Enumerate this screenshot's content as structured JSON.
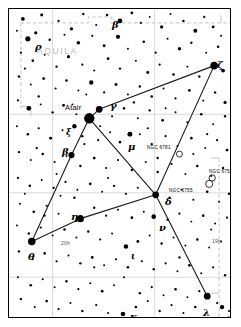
{
  "figure": {
    "kind": "star-chart",
    "constellation_label": "AQUILA",
    "width": 241,
    "height": 327,
    "background": "#ffffff",
    "frame_color": "#000000",
    "grid_color": "#c8c8c8",
    "boundary_color": "#bdbdbd",
    "line_color": "#1a1a1a",
    "star_color": "#000000"
  },
  "labels": {
    "constellation": "AQUILA",
    "proper_star": "Atair",
    "hour_left": "20h",
    "hour_right": "19h",
    "flamsteed_12": "12"
  },
  "greek_labels": [
    {
      "id": "beta-top",
      "text": "β",
      "x": 103,
      "y": 11,
      "size": "lg"
    },
    {
      "id": "rho",
      "text": "ρ",
      "x": 26,
      "y": 33,
      "size": "lg"
    },
    {
      "id": "zeta",
      "text": "ζ",
      "x": 208,
      "y": 51,
      "size": "lg"
    },
    {
      "id": "gamma",
      "text": "γ",
      "x": 101,
      "y": 92,
      "size": "lg"
    },
    {
      "id": "xi",
      "text": "ξ",
      "x": 57,
      "y": 119,
      "size": "sm"
    },
    {
      "id": "beta-aql",
      "text": "β",
      "x": 53,
      "y": 138,
      "size": "lg"
    },
    {
      "id": "mu",
      "text": "μ",
      "x": 119,
      "y": 133,
      "size": "lg"
    },
    {
      "id": "delta",
      "text": "δ",
      "x": 156,
      "y": 188,
      "size": "lg"
    },
    {
      "id": "eta",
      "text": "η",
      "x": 62,
      "y": 203,
      "size": "lg"
    },
    {
      "id": "nu",
      "text": "ν",
      "x": 150,
      "y": 214,
      "size": "lg"
    },
    {
      "id": "theta",
      "text": "θ",
      "x": 19,
      "y": 243,
      "size": "lg"
    },
    {
      "id": "iota",
      "text": "ι",
      "x": 122,
      "y": 243,
      "size": "sm"
    },
    {
      "id": "lambda",
      "text": "λ",
      "x": 194,
      "y": 299,
      "size": "lg"
    },
    {
      "id": "kappa",
      "text": "κ",
      "x": 121,
      "y": 303,
      "size": "lg"
    }
  ],
  "deepsky": [
    {
      "id": "ngc-6781",
      "label": "NGC 6781",
      "label_x": 138,
      "label_y": 137,
      "x": 172,
      "y": 146,
      "r": 3.0,
      "type": "planetary-nebula"
    },
    {
      "id": "ngc-6756",
      "label": "NGC 6756",
      "label_x": 200,
      "label_y": 161,
      "x": 205,
      "y": 170,
      "r": 3.2,
      "type": "open-cluster"
    },
    {
      "id": "ngc-6755",
      "label": "NGC 6755",
      "label_x": 160,
      "label_y": 180,
      "x": 202,
      "y": 176,
      "r": 3.6,
      "type": "open-cluster"
    }
  ],
  "hour_marks": [
    {
      "text": "20h",
      "x": 52,
      "y": 232
    },
    {
      "text": "19h",
      "x": 203,
      "y": 230
    }
  ],
  "flamsteed": [
    {
      "text": "12",
      "x": 218,
      "y": 307
    }
  ],
  "chart_data": {
    "type": "scatter",
    "xlabel": "Right ascension",
    "ylabel": "Declination",
    "grid": true,
    "legend": "none",
    "xlim": [
      0,
      223
    ],
    "ylim": [
      0,
      310
    ],
    "grid_lines": {
      "vertical_x": [
        44,
        147
      ],
      "horizontal_y": [
        106,
        185,
        270
      ],
      "note": "light grey coordinate graticule inside frame"
    },
    "constellation_lines": [
      {
        "from": "zeta",
        "to": "gamma",
        "x1": 207,
        "y1": 57,
        "x2": 91,
        "y2": 101
      },
      {
        "from": "gamma",
        "to": "altair",
        "x1": 91,
        "y1": 101,
        "x2": 81,
        "y2": 110
      },
      {
        "from": "altair",
        "to": "beta",
        "x1": 81,
        "y1": 110,
        "x2": 63,
        "y2": 147
      },
      {
        "from": "beta",
        "to": "theta",
        "x1": 63,
        "y1": 147,
        "x2": 23,
        "y2": 234
      },
      {
        "from": "theta",
        "to": "eta",
        "x1": 23,
        "y1": 234,
        "x2": 72,
        "y2": 211
      },
      {
        "from": "eta",
        "to": "delta",
        "x1": 72,
        "y1": 211,
        "x2": 148,
        "y2": 187
      },
      {
        "from": "delta",
        "to": "altair",
        "x1": 148,
        "y1": 187,
        "x2": 81,
        "y2": 110
      },
      {
        "from": "zeta",
        "to": "delta",
        "x1": 207,
        "y1": 57,
        "x2": 148,
        "y2": 187
      },
      {
        "from": "delta",
        "to": "lambda",
        "x1": 148,
        "y1": 187,
        "x2": 200,
        "y2": 289
      }
    ],
    "named_stars": [
      {
        "name": "Atair",
        "bayer": "alpha",
        "x": 81,
        "y": 110,
        "mag_r": 5.2
      },
      {
        "name": "Gamma",
        "bayer": "gamma",
        "x": 91,
        "y": 101,
        "mag_r": 3.4
      },
      {
        "name": "Beta",
        "bayer": "beta",
        "x": 63,
        "y": 147,
        "mag_r": 3.1
      },
      {
        "name": "Zeta",
        "bayer": "zeta",
        "x": 207,
        "y": 57,
        "mag_r": 3.8
      },
      {
        "name": "Delta",
        "bayer": "delta",
        "x": 148,
        "y": 187,
        "mag_r": 3.4
      },
      {
        "name": "Eta",
        "bayer": "eta",
        "x": 72,
        "y": 211,
        "mag_r": 3.6
      },
      {
        "name": "Theta",
        "bayer": "theta",
        "x": 23,
        "y": 234,
        "mag_r": 3.8
      },
      {
        "name": "Lambda",
        "bayer": "lambda",
        "x": 200,
        "y": 289,
        "mag_r": 3.4
      },
      {
        "name": "Nu",
        "bayer": "nu",
        "x": 146,
        "y": 209,
        "mag_r": 2.3
      },
      {
        "name": "Mu",
        "bayer": "mu",
        "x": 122,
        "y": 126,
        "mag_r": 2.5
      },
      {
        "name": "Xi",
        "bayer": "xi",
        "x": 66,
        "y": 118,
        "mag_r": 2.2
      },
      {
        "name": "Kappa",
        "bayer": "kappa",
        "x": 115,
        "y": 307,
        "mag_r": 2.3
      },
      {
        "name": "Iota",
        "bayer": "iota",
        "x": 118,
        "y": 239,
        "mag_r": 2.3
      },
      {
        "name": "Rho",
        "bayer": "rho",
        "x": 19,
        "y": 30,
        "mag_r": 2.6
      },
      {
        "name": "Beta-top",
        "bayer": "beta",
        "x": 112,
        "y": 12,
        "mag_r": 2.4
      },
      {
        "name": "12",
        "bayer": "12",
        "x": 215,
        "y": 300,
        "mag_r": 2.2
      }
    ],
    "field_stars": [
      [
        14,
        10,
        1.9
      ],
      [
        33,
        6,
        1.5
      ],
      [
        50,
        12,
        1.1
      ],
      [
        63,
        20,
        1.7
      ],
      [
        75,
        5,
        1.2
      ],
      [
        88,
        16,
        1.0
      ],
      [
        99,
        6,
        1.3
      ],
      [
        124,
        4,
        1.4
      ],
      [
        133,
        14,
        1.1
      ],
      [
        142,
        8,
        0.9
      ],
      [
        154,
        18,
        1.6
      ],
      [
        163,
        5,
        1.0
      ],
      [
        176,
        12,
        1.2
      ],
      [
        188,
        22,
        2.0
      ],
      [
        197,
        8,
        1.1
      ],
      [
        206,
        18,
        1.4
      ],
      [
        214,
        27,
        1.0
      ],
      [
        8,
        22,
        1.0
      ],
      [
        27,
        24,
        1.6
      ],
      [
        41,
        31,
        1.2
      ],
      [
        56,
        26,
        1.0
      ],
      [
        70,
        34,
        1.8
      ],
      [
        84,
        27,
        1.1
      ],
      [
        96,
        37,
        1.5
      ],
      [
        110,
        28,
        2.1
      ],
      [
        120,
        40,
        1.0
      ],
      [
        136,
        33,
        1.3
      ],
      [
        148,
        44,
        1.1
      ],
      [
        160,
        30,
        1.0
      ],
      [
        172,
        40,
        1.7
      ],
      [
        184,
        34,
        1.2
      ],
      [
        199,
        44,
        1.0
      ],
      [
        211,
        38,
        1.3
      ],
      [
        12,
        44,
        1.1
      ],
      [
        24,
        52,
        1.3
      ],
      [
        36,
        46,
        1.0
      ],
      [
        48,
        58,
        1.2
      ],
      [
        60,
        48,
        1.6
      ],
      [
        74,
        56,
        1.1
      ],
      [
        86,
        62,
        1.0
      ],
      [
        100,
        50,
        1.4
      ],
      [
        112,
        60,
        1.2
      ],
      [
        128,
        52,
        1.0
      ],
      [
        140,
        64,
        1.5
      ],
      [
        152,
        56,
        1.1
      ],
      [
        166,
        66,
        1.3
      ],
      [
        180,
        58,
        1.0
      ],
      [
        192,
        68,
        1.2
      ],
      [
        216,
        62,
        1.9
      ],
      [
        10,
        68,
        1.2
      ],
      [
        22,
        76,
        1.0
      ],
      [
        35,
        70,
        1.4
      ],
      [
        47,
        80,
        1.1
      ],
      [
        58,
        72,
        1.3
      ],
      [
        70,
        82,
        1.0
      ],
      [
        83,
        74,
        2.2
      ],
      [
        96,
        84,
        1.1
      ],
      [
        108,
        76,
        1.5
      ],
      [
        120,
        86,
        1.0
      ],
      [
        132,
        78,
        1.2
      ],
      [
        144,
        88,
        1.3
      ],
      [
        156,
        80,
        1.0
      ],
      [
        168,
        90,
        1.1
      ],
      [
        182,
        82,
        1.4
      ],
      [
        196,
        92,
        1.0
      ],
      [
        208,
        84,
        1.2
      ],
      [
        218,
        94,
        1.6
      ],
      [
        9,
        92,
        1.1
      ],
      [
        20,
        100,
        2.4
      ],
      [
        32,
        96,
        1.0
      ],
      [
        44,
        104,
        1.2
      ],
      [
        55,
        97,
        1.5
      ],
      [
        68,
        106,
        1.0
      ],
      [
        104,
        108,
        1.1
      ],
      [
        116,
        100,
        1.3
      ],
      [
        130,
        110,
        1.0
      ],
      [
        142,
        102,
        1.2
      ],
      [
        155,
        112,
        1.4
      ],
      [
        168,
        104,
        1.0
      ],
      [
        180,
        114,
        1.1
      ],
      [
        194,
        106,
        1.3
      ],
      [
        206,
        116,
        1.0
      ],
      [
        218,
        108,
        1.2
      ],
      [
        8,
        118,
        1.0
      ],
      [
        19,
        126,
        1.3
      ],
      [
        30,
        120,
        1.1
      ],
      [
        42,
        130,
        1.5
      ],
      [
        54,
        122,
        1.0
      ],
      [
        74,
        128,
        1.2
      ],
      [
        90,
        132,
        1.1
      ],
      [
        102,
        124,
        1.0
      ],
      [
        112,
        134,
        1.3
      ],
      [
        132,
        126,
        1.0
      ],
      [
        144,
        136,
        1.2
      ],
      [
        158,
        128,
        1.1
      ],
      [
        170,
        138,
        1.0
      ],
      [
        184,
        130,
        1.3
      ],
      [
        198,
        140,
        1.0
      ],
      [
        210,
        132,
        1.1
      ],
      [
        220,
        142,
        1.4
      ],
      [
        10,
        144,
        1.2
      ],
      [
        22,
        152,
        1.0
      ],
      [
        34,
        146,
        1.3
      ],
      [
        46,
        154,
        1.1
      ],
      [
        58,
        148,
        1.0
      ],
      [
        72,
        158,
        1.2
      ],
      [
        86,
        150,
        1.4
      ],
      [
        98,
        160,
        1.0
      ],
      [
        110,
        152,
        1.1
      ],
      [
        124,
        162,
        1.3
      ],
      [
        138,
        154,
        1.0
      ],
      [
        150,
        164,
        1.2
      ],
      [
        164,
        156,
        1.1
      ],
      [
        178,
        166,
        1.0
      ],
      [
        190,
        158,
        1.3
      ],
      [
        204,
        168,
        1.0
      ],
      [
        216,
        160,
        1.2
      ],
      [
        9,
        170,
        1.1
      ],
      [
        21,
        178,
        1.3
      ],
      [
        33,
        172,
        1.0
      ],
      [
        45,
        180,
        1.2
      ],
      [
        57,
        174,
        1.1
      ],
      [
        69,
        182,
        1.0
      ],
      [
        82,
        176,
        1.4
      ],
      [
        94,
        184,
        1.0
      ],
      [
        106,
        178,
        1.2
      ],
      [
        118,
        186,
        1.1
      ],
      [
        130,
        180,
        1.0
      ],
      [
        162,
        190,
        1.2
      ],
      [
        174,
        182,
        1.0
      ],
      [
        186,
        192,
        1.1
      ],
      [
        200,
        184,
        1.3
      ],
      [
        212,
        194,
        1.0
      ],
      [
        222,
        186,
        1.2
      ],
      [
        11,
        196,
        1.0
      ],
      [
        25,
        204,
        1.3
      ],
      [
        38,
        198,
        1.1
      ],
      [
        50,
        206,
        1.0
      ],
      [
        86,
        200,
        1.2
      ],
      [
        98,
        208,
        1.1
      ],
      [
        110,
        202,
        1.0
      ],
      [
        124,
        210,
        1.4
      ],
      [
        136,
        204,
        1.0
      ],
      [
        160,
        212,
        1.2
      ],
      [
        172,
        206,
        1.1
      ],
      [
        184,
        214,
        1.0
      ],
      [
        196,
        208,
        1.3
      ],
      [
        208,
        216,
        1.0
      ],
      [
        220,
        210,
        1.1
      ],
      [
        8,
        218,
        1.0
      ],
      [
        20,
        226,
        1.2
      ],
      [
        32,
        220,
        1.1
      ],
      [
        44,
        228,
        1.0
      ],
      [
        56,
        222,
        1.3
      ],
      [
        68,
        230,
        1.0
      ],
      [
        80,
        224,
        1.2
      ],
      [
        92,
        232,
        1.1
      ],
      [
        104,
        226,
        1.0
      ],
      [
        130,
        234,
        1.4
      ],
      [
        142,
        228,
        1.0
      ],
      [
        154,
        236,
        1.2
      ],
      [
        166,
        230,
        1.1
      ],
      [
        178,
        238,
        1.0
      ],
      [
        190,
        232,
        1.3
      ],
      [
        202,
        240,
        1.0
      ],
      [
        214,
        234,
        1.1
      ],
      [
        10,
        244,
        1.2
      ],
      [
        24,
        252,
        1.0
      ],
      [
        36,
        246,
        1.3
      ],
      [
        48,
        254,
        1.1
      ],
      [
        60,
        248,
        1.0
      ],
      [
        72,
        256,
        1.2
      ],
      [
        84,
        250,
        1.4
      ],
      [
        96,
        258,
        1.0
      ],
      [
        108,
        252,
        1.1
      ],
      [
        120,
        260,
        1.3
      ],
      [
        134,
        254,
        1.0
      ],
      [
        146,
        262,
        1.2
      ],
      [
        158,
        256,
        1.1
      ],
      [
        170,
        264,
        1.0
      ],
      [
        182,
        258,
        1.3
      ],
      [
        194,
        266,
        1.0
      ],
      [
        206,
        260,
        1.1
      ],
      [
        218,
        268,
        1.2
      ],
      [
        9,
        270,
        1.0
      ],
      [
        22,
        278,
        1.3
      ],
      [
        34,
        272,
        1.1
      ],
      [
        46,
        280,
        1.0
      ],
      [
        58,
        274,
        1.2
      ],
      [
        70,
        282,
        1.1
      ],
      [
        82,
        276,
        1.0
      ],
      [
        94,
        284,
        1.4
      ],
      [
        106,
        278,
        1.0
      ],
      [
        132,
        286,
        1.2
      ],
      [
        144,
        280,
        1.1
      ],
      [
        156,
        288,
        1.0
      ],
      [
        168,
        282,
        1.3
      ],
      [
        180,
        290,
        1.0
      ],
      [
        192,
        284,
        1.1
      ],
      [
        12,
        292,
        1.2
      ],
      [
        26,
        300,
        1.0
      ],
      [
        38,
        294,
        1.3
      ],
      [
        50,
        302,
        1.1
      ],
      [
        62,
        296,
        1.0
      ],
      [
        74,
        304,
        1.2
      ],
      [
        88,
        298,
        1.1
      ],
      [
        100,
        306,
        1.0
      ],
      [
        128,
        300,
        1.3
      ],
      [
        140,
        294,
        1.0
      ],
      [
        152,
        304,
        1.2
      ],
      [
        164,
        298,
        1.1
      ],
      [
        176,
        306,
        1.0
      ],
      [
        188,
        300,
        1.3
      ],
      [
        210,
        296,
        1.1
      ],
      [
        222,
        304,
        1.0
      ],
      [
        16,
        60,
        1.1
      ],
      [
        30,
        88,
        1.2
      ],
      [
        64,
        96,
        1.0
      ],
      [
        76,
        136,
        1.1
      ],
      [
        92,
        118,
        1.0
      ],
      [
        126,
        94,
        1.2
      ],
      [
        158,
        100,
        1.0
      ],
      [
        200,
        126,
        1.1
      ],
      [
        48,
        166,
        1.0
      ],
      [
        66,
        190,
        1.2
      ],
      [
        100,
        170,
        1.0
      ],
      [
        140,
        120,
        1.1
      ],
      [
        186,
        146,
        1.0
      ],
      [
        28,
        140,
        1.2
      ],
      [
        16,
        186,
        1.0
      ],
      [
        86,
        260,
        1.1
      ],
      [
        116,
        270,
        1.0
      ],
      [
        172,
        250,
        1.2
      ],
      [
        204,
        222,
        1.0
      ],
      [
        36,
        208,
        1.1
      ],
      [
        52,
        188,
        1.0
      ],
      [
        150,
        150,
        1.2
      ],
      [
        78,
        86,
        1.0
      ]
    ]
  }
}
